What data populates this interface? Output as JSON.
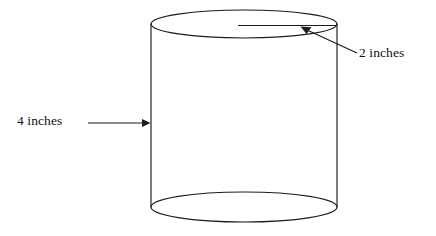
{
  "figure": {
    "type": "geometry-diagram",
    "shape": "cylinder",
    "background_color": "#ffffff",
    "line_color": "#1c1c1c",
    "text_color": "#111111",
    "labels": {
      "height": "4 inches",
      "radius": "2 inches"
    },
    "annotations": [
      {
        "name": "height-dimension",
        "text": "4 inches",
        "points_to": "cylinder-left-side",
        "arrow_direction": "right"
      },
      {
        "name": "radius-dimension",
        "text": "2 inches",
        "points_to": "top-face-radius-line",
        "arrow_direction": "up-left"
      }
    ],
    "geometry": {
      "top_ellipse": {
        "cx": 244,
        "cy": 24,
        "rx": 93,
        "ry": 14
      },
      "bottom_ellipse": {
        "cx": 244,
        "cy": 207,
        "rx": 93,
        "ry": 15
      },
      "left_side": {
        "x": 151,
        "y1": 24,
        "y2": 207
      },
      "right_side": {
        "x": 337,
        "y1": 24,
        "y2": 207
      },
      "radius_line": {
        "x1": 238,
        "y1": 25,
        "x2": 337,
        "y2": 25
      }
    }
  }
}
